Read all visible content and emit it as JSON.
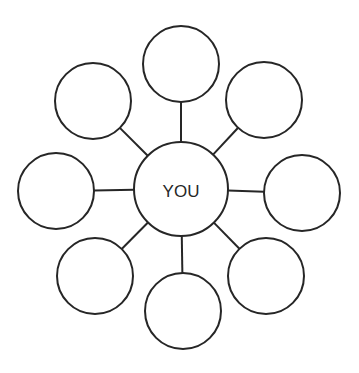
{
  "diagram": {
    "type": "mind-map",
    "center": {
      "label": "YOU",
      "cx": 181,
      "cy": 189,
      "r": 47
    },
    "nodes": [
      {
        "id": "top",
        "label": "",
        "cx": 181,
        "cy": 64,
        "r": 38
      },
      {
        "id": "top-right",
        "label": "",
        "cx": 264,
        "cy": 100,
        "r": 38
      },
      {
        "id": "right",
        "label": "",
        "cx": 302,
        "cy": 193,
        "r": 38
      },
      {
        "id": "bottom-right",
        "label": "",
        "cx": 266,
        "cy": 276,
        "r": 38
      },
      {
        "id": "bottom",
        "label": "",
        "cx": 183,
        "cy": 311,
        "r": 38
      },
      {
        "id": "bottom-left",
        "label": "",
        "cx": 95,
        "cy": 276,
        "r": 38
      },
      {
        "id": "left",
        "label": "",
        "cx": 56,
        "cy": 191,
        "r": 38
      },
      {
        "id": "top-left",
        "label": "",
        "cx": 93,
        "cy": 101,
        "r": 38
      }
    ],
    "colors": {
      "stroke": "#262626",
      "background": "#ffffff"
    }
  }
}
